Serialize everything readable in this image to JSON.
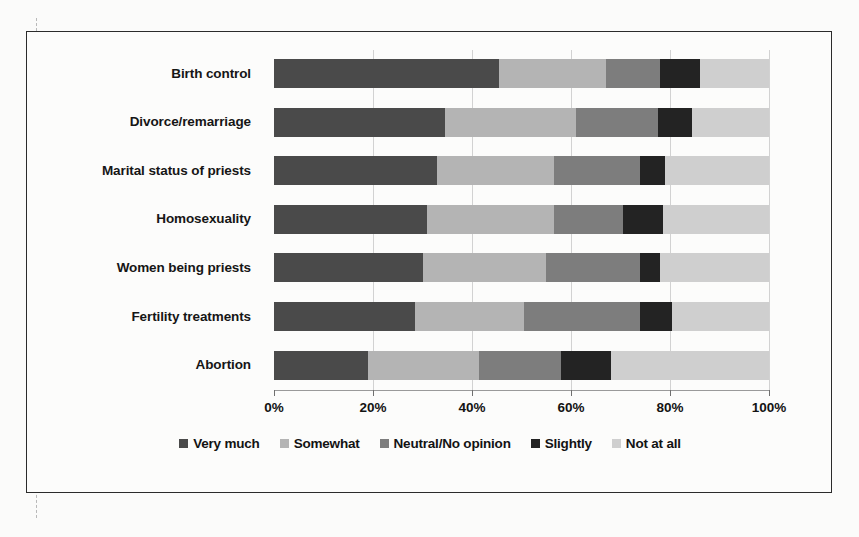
{
  "chart_data": {
    "type": "bar",
    "orientation": "horizontal",
    "stacked": true,
    "normalized_percent": true,
    "title": "",
    "subtitle": "",
    "xlabel": "",
    "ylabel": "",
    "xlim": [
      0,
      100
    ],
    "xticks": [
      0,
      20,
      40,
      60,
      80,
      100
    ],
    "xtick_labels": [
      "0%",
      "20%",
      "40%",
      "60%",
      "80%",
      "100%"
    ],
    "grid": true,
    "legend_position": "bottom",
    "categories": [
      "Birth control",
      "Divorce/remarriage",
      "Marital status of priests",
      "Homosexuality",
      "Women being priests",
      "Fertility treatments",
      "Abortion"
    ],
    "series": [
      {
        "name": "Very much",
        "color": "#4a4a4a",
        "values": [
          45.5,
          34.5,
          33.0,
          31.0,
          30.0,
          28.5,
          19.0
        ]
      },
      {
        "name": "Somewhat",
        "color": "#b4b4b4",
        "values": [
          21.5,
          26.5,
          23.5,
          25.5,
          25.0,
          22.0,
          22.5
        ]
      },
      {
        "name": "Neutral/No opinion",
        "color": "#7d7d7d",
        "values": [
          11.0,
          16.5,
          17.5,
          14.0,
          19.0,
          23.5,
          16.5
        ]
      },
      {
        "name": "Slightly",
        "color": "#232323",
        "values": [
          8.0,
          7.0,
          5.0,
          8.0,
          4.0,
          6.5,
          10.0
        ]
      },
      {
        "name": "Not at all",
        "color": "#cfcfcf",
        "values": [
          14.0,
          15.5,
          21.0,
          21.5,
          22.0,
          19.5,
          32.0
        ]
      }
    ]
  },
  "legend": {
    "items": [
      {
        "label": "Very much",
        "color": "#4a4a4a"
      },
      {
        "label": "Somewhat",
        "color": "#b4b4b4"
      },
      {
        "label": "Neutral/No opinion",
        "color": "#7d7d7d"
      },
      {
        "label": "Slightly",
        "color": "#232323"
      },
      {
        "label": "Not at all",
        "color": "#cfcfcf"
      }
    ]
  }
}
